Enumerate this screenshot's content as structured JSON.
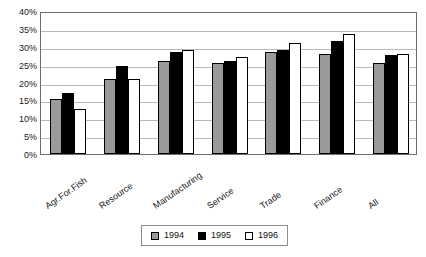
{
  "chart_data": {
    "type": "bar",
    "title": "",
    "xlabel": "",
    "ylabel": "",
    "ylim": [
      0,
      40
    ],
    "ytick_labels": [
      "40%",
      "35%",
      "30%",
      "25%",
      "20%",
      "15%",
      "10%",
      "5%",
      "0%"
    ],
    "ytick_values": [
      40,
      35,
      30,
      25,
      20,
      15,
      10,
      5,
      0
    ],
    "grid": true,
    "legend_position": "bottom-center",
    "categories": [
      "Agr.For.Fish",
      "Resource",
      "Manufacturing",
      "Service",
      "Trade",
      "Finance",
      "All"
    ],
    "series": [
      {
        "name": "1994",
        "color": "#9a9a9a",
        "values": [
          15.5,
          21.0,
          26.0,
          25.5,
          28.5,
          28.0,
          25.5
        ]
      },
      {
        "name": "1995",
        "color": "#000000",
        "values": [
          17.0,
          24.5,
          28.5,
          26.0,
          29.0,
          31.5,
          27.8
        ]
      },
      {
        "name": "1996",
        "color": "#ffffff",
        "values": [
          12.5,
          21.0,
          29.0,
          27.0,
          31.0,
          33.5,
          28.0
        ]
      }
    ]
  },
  "legend": {
    "entries": [
      {
        "label": "1994"
      },
      {
        "label": "1995"
      },
      {
        "label": "1996"
      }
    ]
  }
}
